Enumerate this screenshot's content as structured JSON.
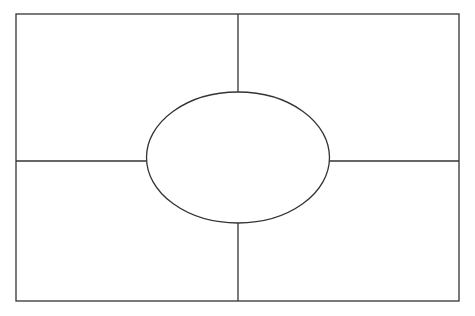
{
  "diagram": {
    "type": "four-square organizer",
    "stroke_color": "#333333",
    "background_color": "#ffffff",
    "outer_frame": {
      "x": 16,
      "y": 14,
      "width": 443,
      "height": 287
    },
    "vertical_divider_x": 238,
    "horizontal_divider_y": 161,
    "center_ellipse": {
      "cx": 238,
      "cy": 157.5,
      "rx": 91.5,
      "ry": 65.5
    },
    "quadrants": [
      {
        "name": "top-left",
        "text": ""
      },
      {
        "name": "top-right",
        "text": ""
      },
      {
        "name": "bottom-left",
        "text": ""
      },
      {
        "name": "bottom-right",
        "text": ""
      }
    ],
    "center_text": ""
  }
}
